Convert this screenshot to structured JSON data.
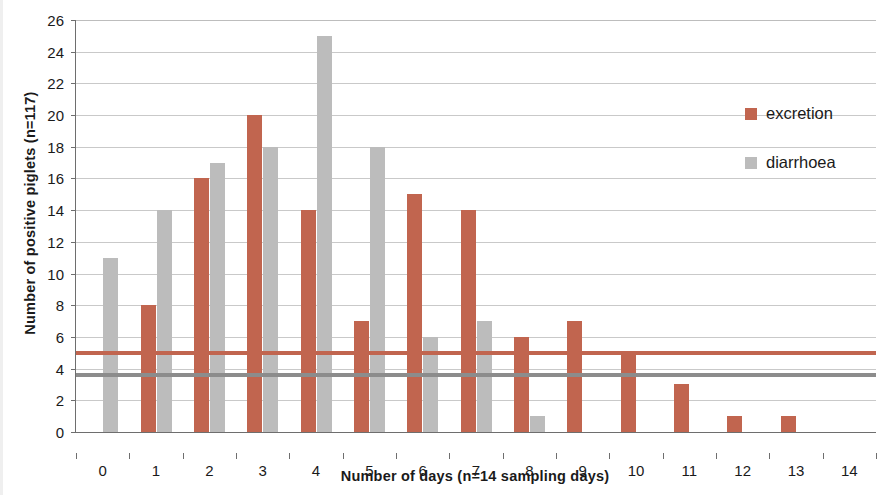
{
  "chart_data": {
    "type": "bar",
    "title": "",
    "xlabel": "Number of days (n=14 sampling days)",
    "ylabel": "Number of positive piglets (n=117)",
    "categories": [
      "0",
      "1",
      "2",
      "3",
      "4",
      "5",
      "6",
      "7",
      "8",
      "9",
      "10",
      "11",
      "12",
      "13",
      "14"
    ],
    "series": [
      {
        "name": "excretion",
        "color": "#c1654f",
        "values": [
          0,
          8,
          16,
          20,
          14,
          7,
          15,
          14,
          6,
          7,
          5,
          3,
          1,
          1,
          0
        ]
      },
      {
        "name": "diarrhoea",
        "color": "#bcbcbc",
        "values": [
          11,
          14,
          17,
          18,
          25,
          18,
          6,
          7,
          1,
          0,
          0,
          0,
          0,
          0,
          0
        ]
      }
    ],
    "trendlines": [
      {
        "name": "excretion-trend",
        "color": "#c1654f",
        "value": 5.0
      },
      {
        "name": "diarrhoea-trend",
        "color": "#8c8c8c",
        "value": 3.6
      }
    ],
    "ylim": [
      0,
      26
    ],
    "ytick_step": 2,
    "yticks": [
      0,
      2,
      4,
      6,
      8,
      10,
      12,
      14,
      16,
      18,
      20,
      22,
      24,
      26
    ],
    "grid": true,
    "legend_position": "right"
  },
  "legend": {
    "items": [
      {
        "label": "excretion",
        "swatch": "excretion"
      },
      {
        "label": "diarrhoea",
        "swatch": "diarrhoea"
      }
    ]
  }
}
